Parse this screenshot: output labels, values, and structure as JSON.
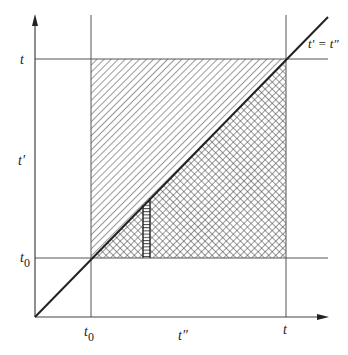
{
  "diagram": {
    "colors": {
      "ink": "#333333",
      "background": "#ffffff"
    },
    "axes": {
      "y_label": "t'",
      "x_label": "t''",
      "y_ticks": [
        {
          "label": "t",
          "position": "top"
        },
        {
          "label": "t0",
          "position": "lower"
        }
      ],
      "x_ticks": [
        {
          "label": "t0",
          "position": "left"
        },
        {
          "label": "t",
          "position": "right"
        }
      ]
    },
    "diagonal_label": "t' = t''",
    "regions": [
      {
        "name": "upper-triangle",
        "fill": "single diagonal hatch"
      },
      {
        "name": "lower-triangle",
        "fill": "cross hatch"
      },
      {
        "name": "vertical-strip",
        "fill": "horizontal lines"
      }
    ]
  },
  "labels": {
    "y_axis": "t'",
    "x_axis": "t″",
    "y_tick_t": "t",
    "y_tick_t0": "t",
    "y_tick_t0_sub": "0",
    "x_tick_t0": "t",
    "x_tick_t0_sub": "0",
    "x_tick_t": "t",
    "diagonal": "t' = t″"
  }
}
